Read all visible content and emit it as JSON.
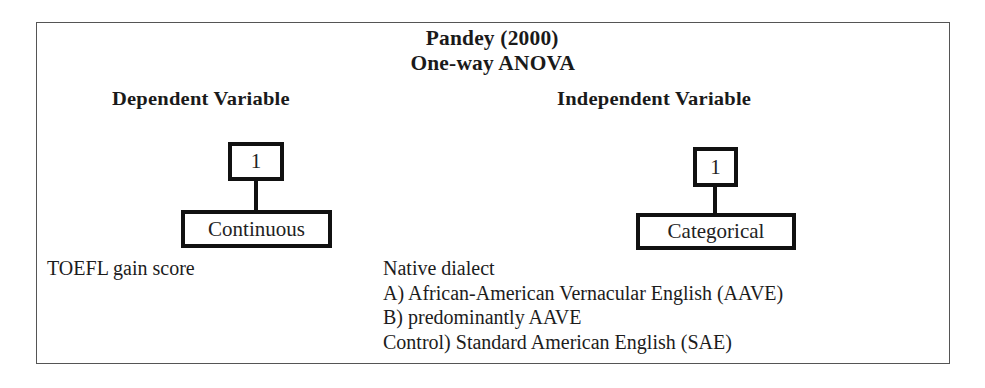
{
  "diagram": {
    "title": "Pandey (2000)",
    "subtitle": "One-way ANOVA",
    "dependent": {
      "heading": "Dependent Variable",
      "count": "1",
      "type": "Continuous",
      "variable": "TOEFL gain score"
    },
    "independent": {
      "heading": "Independent Variable",
      "count": "1",
      "type": "Categorical",
      "variable": "Native dialect",
      "levels": [
        "A) African-American Vernacular English (AAVE)",
        "B) predominantly AAVE",
        "Control) Standard American English (SAE)"
      ]
    }
  },
  "colors": {
    "frame": "#555555",
    "box_border": "#111111",
    "text": "#1c1c1c",
    "background": "#ffffff"
  }
}
